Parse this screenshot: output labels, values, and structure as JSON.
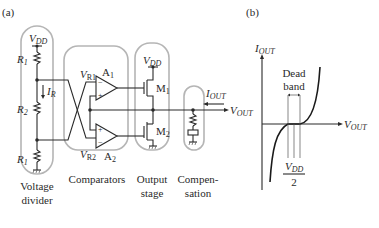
{
  "panels": {
    "a": {
      "label": "(a)",
      "supply": {
        "main": "V",
        "sub": "DD"
      },
      "resistors": [
        {
          "name": "R",
          "sub": "1"
        },
        {
          "name": "R",
          "sub": "2"
        },
        {
          "name": "R",
          "sub": "1"
        }
      ],
      "current": {
        "main": "I",
        "sub": "R"
      },
      "comparators": {
        "vr1": {
          "main": "V",
          "sub": "R1"
        },
        "vr2": {
          "main": "V",
          "sub": "R2"
        },
        "a1": {
          "main": "A",
          "sub": "1"
        },
        "a2": {
          "main": "A",
          "sub": "2"
        },
        "plus": "+",
        "minus": "−"
      },
      "output_stage": {
        "supply": {
          "main": "V",
          "sub": "DD"
        },
        "m1": {
          "main": "M",
          "sub": "1"
        },
        "m2": {
          "main": "M",
          "sub": "2"
        }
      },
      "output": {
        "iout": {
          "main": "I",
          "sub": "OUT"
        },
        "vout": {
          "main": "V",
          "sub": "OUT"
        }
      },
      "group_labels": {
        "voltage_divider": [
          "Voltage",
          "divider"
        ],
        "comparators": "Comparators",
        "output_stage": [
          "Output",
          "stage"
        ],
        "compensation": [
          "Compen-",
          "sation"
        ]
      }
    },
    "b": {
      "label": "(b)",
      "y_axis": {
        "main": "I",
        "sub": "OUT"
      },
      "x_axis": {
        "main": "V",
        "sub": "OUT"
      },
      "annotation": [
        "Dead",
        "band"
      ],
      "midpoint": {
        "num_main": "V",
        "num_sub": "DD",
        "den": "2"
      }
    }
  }
}
